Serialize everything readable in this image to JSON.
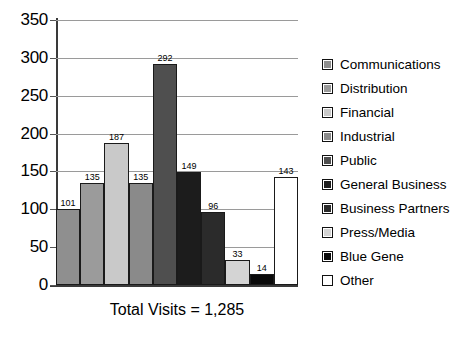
{
  "chart_data": {
    "type": "bar",
    "title": "",
    "caption": "Total Visits = 1,285",
    "xlabel": "",
    "ylabel": "",
    "ylim": [
      0,
      350
    ],
    "ytick_step": 50,
    "yticks": [
      "350",
      "300",
      "250",
      "200",
      "150",
      "100",
      "50",
      "0"
    ],
    "grid": true,
    "legend_position": "right",
    "categories": [
      "Communications",
      "Distribution",
      "Financial",
      "Industrial",
      "Public",
      "General Business",
      "Business Partners",
      "Press/Media",
      "Blue Gene",
      "Other"
    ],
    "values": [
      101,
      135,
      187,
      135,
      292,
      149,
      96,
      33,
      14,
      143
    ],
    "labels": [
      "101",
      "135",
      "187",
      "135",
      "292",
      "149",
      "96",
      "33",
      "14",
      "143"
    ],
    "colors": [
      "#8f8f8f",
      "#9b9b9b",
      "#c9c9c9",
      "#8a8a8a",
      "#4f4f4f",
      "#1c1c1c",
      "#2b2b2b",
      "#d4d4d4",
      "#0a0a0a",
      "#ffffff"
    ],
    "total": "1,285"
  },
  "legend": {
    "items": [
      {
        "label": "Communications",
        "color": "#8f8f8f"
      },
      {
        "label": "Distribution",
        "color": "#9b9b9b"
      },
      {
        "label": "Financial",
        "color": "#c9c9c9"
      },
      {
        "label": "Industrial",
        "color": "#8a8a8a"
      },
      {
        "label": "Public",
        "color": "#4f4f4f"
      },
      {
        "label": "General Business",
        "color": "#1c1c1c"
      },
      {
        "label": "Business Partners",
        "color": "#2b2b2b"
      },
      {
        "label": "Press/Media",
        "color": "#d4d4d4"
      },
      {
        "label": "Blue Gene",
        "color": "#0a0a0a"
      },
      {
        "label": "Other",
        "color": "#ffffff"
      }
    ]
  }
}
